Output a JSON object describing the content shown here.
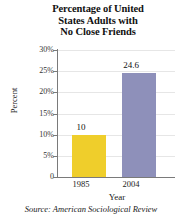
{
  "chart_data": {
    "type": "bar",
    "title": "Percentage of United States Adults with No Close Friends",
    "title_lines": [
      "Percentage of United",
      "States Adults with",
      "No Close Friends"
    ],
    "categories": [
      "1985",
      "2004"
    ],
    "values": [
      10,
      24.6
    ],
    "value_labels": [
      "10",
      "24.6"
    ],
    "xlabel": "Year",
    "ylabel": "Percent",
    "ylim": [
      0,
      30
    ],
    "ytick_values": [
      30,
      25,
      20,
      15,
      10,
      5,
      0
    ],
    "ytick_labels": [
      "30%",
      "25%",
      "20%",
      "15%",
      "10%",
      "5%",
      "0"
    ],
    "grid": true,
    "legend": false,
    "bar_colors": [
      "#EFCE2B",
      "#8E90BA"
    ],
    "source": "Source: American Sociological Review"
  },
  "colors": {
    "bar_1985": "#EFCE2B",
    "bar_2004": "#8E90BA",
    "axis": "#7A7A7A",
    "grid": "#E6E6E6",
    "text": "#111111",
    "background": "#FFFFFF"
  }
}
